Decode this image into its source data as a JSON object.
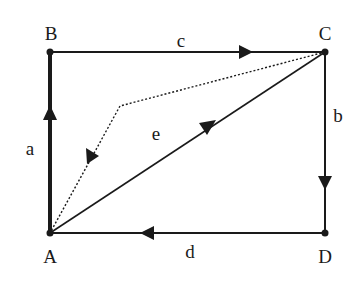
{
  "diagram": {
    "points": {
      "A": {
        "label": "A",
        "x": 50,
        "y": 233
      },
      "B": {
        "label": "B",
        "x": 50,
        "y": 52
      },
      "C": {
        "label": "C",
        "x": 325,
        "y": 52
      },
      "D": {
        "label": "D",
        "x": 325,
        "y": 233
      }
    },
    "edges": [
      {
        "label": "a",
        "from": "A",
        "to": "B",
        "style": "thick"
      },
      {
        "label": "c",
        "from": "B",
        "to": "C",
        "style": "solid"
      },
      {
        "label": "b",
        "from": "C",
        "to": "D",
        "style": "solid"
      },
      {
        "label": "d",
        "from": "D",
        "to": "A",
        "style": "solid"
      },
      {
        "label": "e",
        "from": "A",
        "to": "C",
        "style": "solid"
      },
      {
        "label": "",
        "from": "C",
        "to": "A",
        "style": "dotted",
        "via": [
          120,
          106
        ]
      }
    ],
    "colors": {
      "stroke": "#1a1a1a",
      "background": "#ffffff"
    }
  }
}
